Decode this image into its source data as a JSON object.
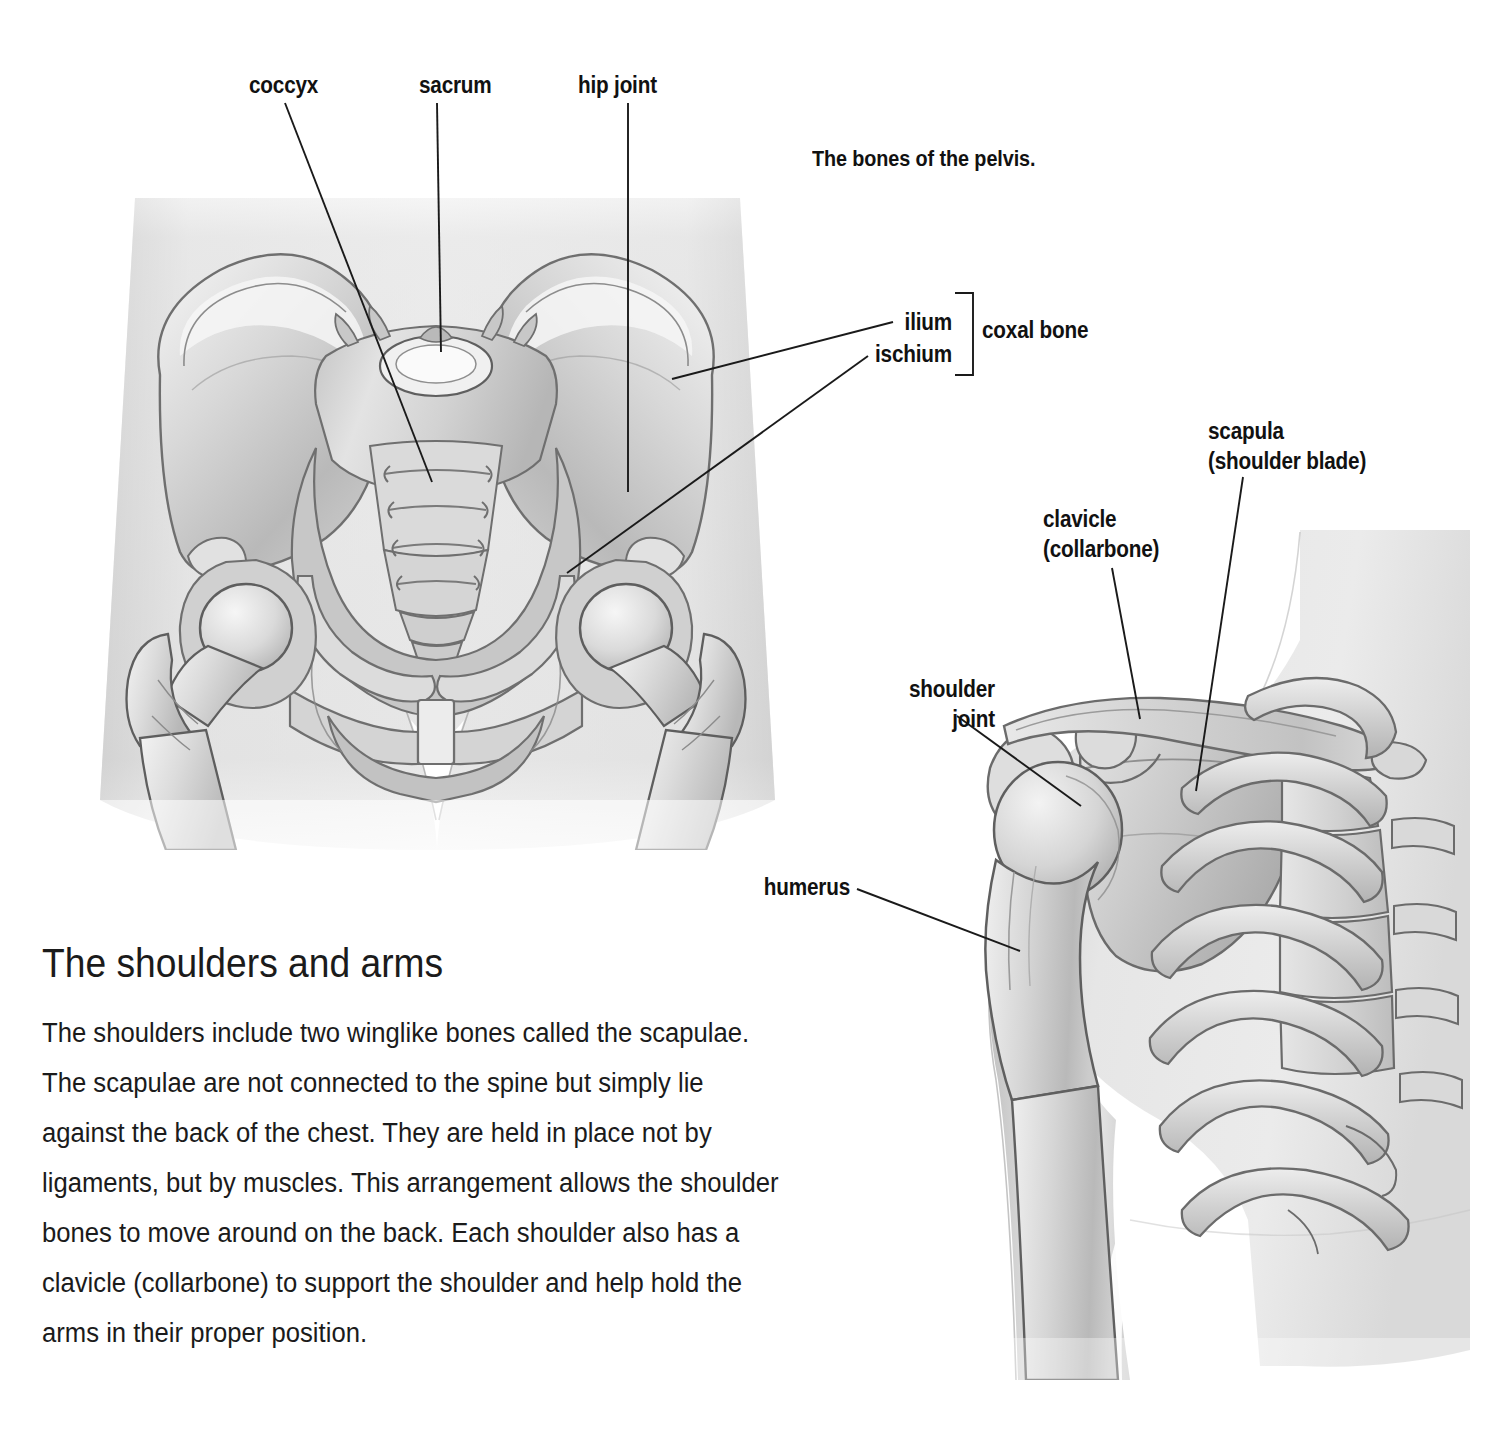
{
  "page": {
    "background": "#ffffff",
    "ink": "#1a1a1a"
  },
  "caption": {
    "pelvis": "The bones of the pelvis."
  },
  "pelvis_labels": {
    "coccyx": "coccyx",
    "sacrum": "sacrum",
    "hip_joint": "hip joint",
    "ilium": "ilium",
    "ischium": "ischium",
    "coxal_bone": "coxal bone"
  },
  "shoulder_labels": {
    "scapula_line1": "scapula",
    "scapula_line2": "(shoulder blade)",
    "clavicle_line1": "clavicle",
    "clavicle_line2": "(collarbone)",
    "shoulder_joint_line1": "shoulder",
    "shoulder_joint_line2": "joint",
    "humerus": "humerus"
  },
  "article": {
    "heading": "The shoulders and arms",
    "paragraph": "The shoulders include two winglike bones called the scapulae. The scapulae are not connected to the spine but simply lie against the back of the chest. They are held in place not by ligaments, but by muscles. This arrangement allows the shoulder bones to move around on the back. Each shoulder also has a clavicle (collarbone) to support the shoulder and help hold the arms in their proper position."
  },
  "figures": {
    "pelvis_alt": "anterior view of the bony pelvis with sacrum, coccyx, coxal bones and femur heads",
    "shoulder_alt": "anterior view of the right shoulder girdle with clavicle, scapula, humerus and ribs"
  }
}
